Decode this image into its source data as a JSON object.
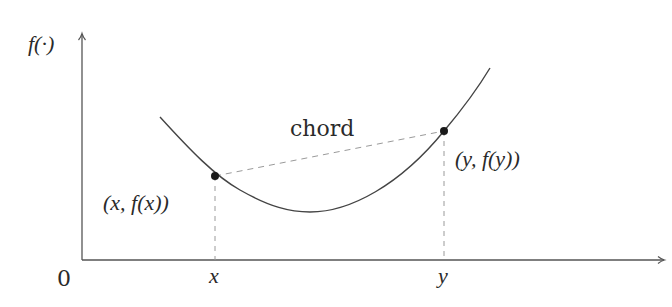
{
  "diagram": {
    "colors": {
      "axis": "#555555",
      "curve": "#444444",
      "dashed": "#9a9a9a",
      "points": "#1a1a1a",
      "text": "#2a2a2a"
    },
    "axes": {
      "y_label": "f(·)",
      "origin_label": "0",
      "x_ticks": [
        {
          "label": "x",
          "px": 215
        },
        {
          "label": "y",
          "px": 444
        }
      ]
    },
    "curve": {
      "description": "convex U-shaped curve f",
      "start": [
        160,
        117
      ],
      "minimum": [
        305,
        212
      ],
      "end": [
        490,
        68
      ]
    },
    "points": [
      {
        "name": "point-x",
        "label": "(x, f(x))",
        "px": [
          215,
          176
        ]
      },
      {
        "name": "point-y",
        "label": "(y, f(y))",
        "px": [
          444,
          131
        ]
      }
    ],
    "chord": {
      "label": "chord",
      "from": [
        215,
        176
      ],
      "to": [
        444,
        131
      ],
      "style": "dashed"
    }
  }
}
